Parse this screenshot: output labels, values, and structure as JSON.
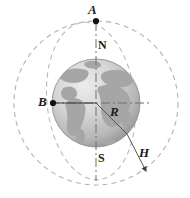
{
  "figure": {
    "kind": "earth-satellite-orbit-diagram",
    "background_color": "#ffffff",
    "width": 190,
    "height": 198,
    "labels": {
      "point_a": "A",
      "point_b": "B",
      "north_pole": "N",
      "south_pole": "S",
      "radius": "R",
      "altitude": "H"
    },
    "icons": {
      "point_a_marker": "filled-dot-marker",
      "point_b_marker": "filled-dot-marker",
      "altitude_arrow": "arrow-head-icon",
      "globe": "earth-globe-icon"
    },
    "colors": {
      "globe_light": "#dcdcdc",
      "globe_mid": "#bfbfbf",
      "globe_dark": "#9a9a9a",
      "land": "#a8a8a8",
      "orbit_dash": "#b0b0b0",
      "axis_line": "#6e6e6e",
      "marker_fill": "#111111",
      "label_text": "#1a1a1a"
    },
    "geometry": {
      "globe_center_x": 96,
      "globe_center_y": 103,
      "globe_radius": 44,
      "outer_orbit_radius": 82,
      "inner_orbit_radius_x": 44,
      "inner_orbit_radius_y": 79,
      "point_a_x": 96,
      "point_a_y": 21,
      "point_b_x": 53,
      "point_b_y": 103,
      "altitude_arrow_tip_x": 148,
      "altitude_arrow_tip_y": 173
    }
  }
}
